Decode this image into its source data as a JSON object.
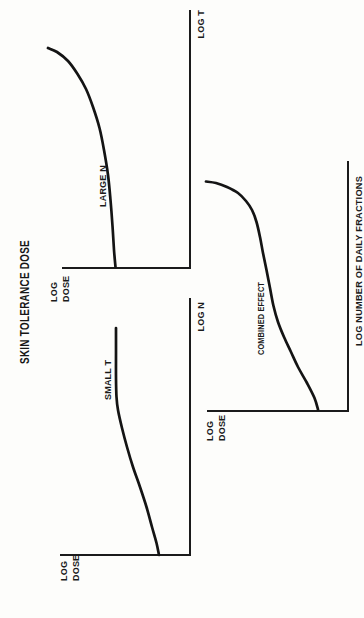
{
  "figure": {
    "title": "SKIN TOLERANCE DOSE",
    "ink_color": "#1b1b1b",
    "background": "#fdfdfb",
    "orientation": "rotated 90deg counterclockwise (rotate page clockwise to read)"
  },
  "chart_data": [
    {
      "type": "line",
      "title": "SKIN TOLERANCE DOSE",
      "panel": "left (readable orientation)",
      "xlabel": "LOG N",
      "ylabel": "LOG DOSE",
      "legend": [
        "SMALL T"
      ],
      "axes_numeric_ticks": false,
      "series": [
        {
          "name": "SMALL T",
          "shape": "rises from y-axis then saturates to a flat plateau",
          "x_norm": [
            0,
            0.11,
            0.26,
            0.42,
            0.56,
            0.69,
            0.79,
            0.88
          ],
          "y_norm": [
            0.24,
            0.29,
            0.38,
            0.48,
            0.55,
            0.57,
            0.57,
            0.57
          ]
        }
      ]
    },
    {
      "type": "line",
      "title": "SKIN TOLERANCE DOSE",
      "panel": "right (readable orientation)",
      "xlabel": "LOG T",
      "ylabel": "LOG DOSE",
      "legend": [
        "LARGE N"
      ],
      "axes_numeric_ticks": false,
      "series": [
        {
          "name": "LARGE N",
          "shape": "nearly flat at left, curving upward ever more steeply at right",
          "x_norm": [
            0,
            0.16,
            0.36,
            0.54,
            0.69,
            0.8,
            0.85
          ],
          "y_norm": [
            0.58,
            0.61,
            0.64,
            0.71,
            0.81,
            0.95,
            1.11
          ]
        }
      ]
    },
    {
      "type": "line",
      "title": "SKIN TOLERANCE DOSE",
      "panel": "bottom (readable orientation)",
      "xlabel": "LOG NUMBER OF DAILY FRACTIONS",
      "ylabel": "LOG DOSE",
      "legend": [
        "COMBINED EFFECT"
      ],
      "axes_numeric_ticks": false,
      "series": [
        {
          "name": "COMBINED EFFECT",
          "shape": "gradual rise from y-axis steepening sharply at the right end",
          "x_norm": [
            0.01,
            0.11,
            0.24,
            0.36,
            0.49,
            0.63,
            0.76,
            0.84,
            0.9,
            0.92
          ],
          "y_norm": [
            0.21,
            0.29,
            0.4,
            0.5,
            0.55,
            0.6,
            0.65,
            0.72,
            0.86,
            1.01
          ]
        }
      ]
    }
  ],
  "render": {
    "panels": [
      {
        "id": "small-t",
        "xlabel": "LOG N",
        "ylabel_lines": [
          "LOG",
          "DOSE"
        ],
        "curve_label": "SMALL T",
        "axis": {
          "y_end": [
            63,
            60
          ],
          "origin": [
            63,
            190
          ],
          "x_end": [
            320,
            190
          ]
        },
        "curve_points": [
          [
            63,
            159
          ],
          [
            75,
            156.5
          ],
          [
            91,
            152
          ],
          [
            111,
            146.5
          ],
          [
            131,
            140
          ],
          [
            151,
            133
          ],
          [
            171,
            127
          ],
          [
            190,
            122
          ],
          [
            208,
            118
          ],
          [
            221,
            116.5
          ],
          [
            240,
            116
          ],
          [
            265,
            116
          ],
          [
            290,
            116
          ]
        ]
      },
      {
        "id": "large-n",
        "xlabel": "LOG T",
        "ylabel_lines": [
          "LOG",
          "DOSE"
        ],
        "curve_label": "LARGE N",
        "axis": {
          "y_end": [
            350,
            62
          ],
          "origin": [
            350,
            190
          ],
          "x_end": [
            608,
            190
          ]
        },
        "curve_points": [
          [
            351,
            115.5
          ],
          [
            368,
            114
          ],
          [
            392,
            112.5
          ],
          [
            418,
            110.5
          ],
          [
            443,
            108
          ],
          [
            468,
            104
          ],
          [
            490,
            99.5
          ],
          [
            511,
            93
          ],
          [
            529,
            86
          ],
          [
            544,
            77.5
          ],
          [
            557,
            68
          ],
          [
            566,
            57
          ],
          [
            570,
            48
          ]
        ]
      },
      {
        "id": "combined-effect",
        "xlabel": "LOG NUMBER OF DAILY FRACTIONS",
        "ylabel_lines": [
          "LOG",
          "DOSE"
        ],
        "curve_label": "COMBINED EFFECT",
        "axis": {
          "y_end": [
            207,
            207
          ],
          "origin": [
            207,
            348
          ],
          "x_end": [
            457,
            348
          ]
        },
        "curve_points": [
          [
            208.5,
            318
          ],
          [
            220,
            314.5
          ],
          [
            235,
            307
          ],
          [
            251,
            298
          ],
          [
            266,
            291
          ],
          [
            281,
            284
          ],
          [
            296,
            278
          ],
          [
            312,
            273.5
          ],
          [
            330,
            270
          ],
          [
            348,
            266.5
          ],
          [
            365,
            263
          ],
          [
            381,
            260
          ],
          [
            396,
            256.5
          ],
          [
            408,
            252
          ],
          [
            417,
            246
          ],
          [
            425,
            238
          ],
          [
            431,
            227
          ],
          [
            435,
            216
          ],
          [
            436.5,
            206
          ]
        ]
      }
    ]
  }
}
